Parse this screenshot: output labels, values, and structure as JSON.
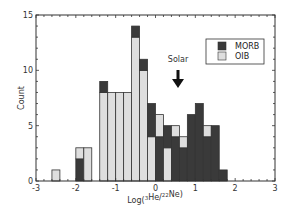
{
  "chart_data": {
    "type": "bar",
    "stacked": true,
    "title": "",
    "xlabel": "Log(3He/22Ne)",
    "xlabel_parts": {
      "prefix": "Log(",
      "sup1": "3",
      "mid": "He/",
      "sup2": "22",
      "suffix": "Ne)"
    },
    "ylabel": "Count",
    "xlim": [
      -3,
      3
    ],
    "ylim": [
      0,
      15
    ],
    "x_ticks": [
      -3,
      -2,
      -1,
      0,
      1,
      2,
      3
    ],
    "y_ticks": [
      0,
      5,
      10,
      15
    ],
    "bin_width": 0.2,
    "bin_starts": [
      -2.6,
      -2.0,
      -1.8,
      -1.4,
      -1.2,
      -1.0,
      -0.8,
      -0.6,
      -0.4,
      -0.2,
      0.0,
      0.2,
      0.4,
      0.6,
      0.8,
      1.0,
      1.2,
      1.4,
      1.6
    ],
    "series": [
      {
        "name": "MORB",
        "color": "#3a3a3a",
        "values": [
          0,
          2,
          0,
          1,
          0,
          0,
          0,
          1,
          1,
          3,
          4,
          2,
          4,
          3,
          6,
          7,
          4,
          5,
          1
        ]
      },
      {
        "name": "OIB",
        "color": "#dedede",
        "values": [
          1,
          1,
          3,
          8,
          8,
          8,
          8,
          13,
          10,
          4,
          2,
          3,
          1,
          1,
          0,
          0,
          1,
          0,
          0
        ]
      }
    ],
    "stack_order_bottom_first": {
      "default": [
        "MORB",
        "OIB"
      ],
      "exceptions": {
        "-1.4": [
          "OIB",
          "MORB"
        ],
        "-0.6": [
          "OIB",
          "MORB"
        ],
        "-0.4": [
          "OIB",
          "MORB"
        ],
        "-0.2": [
          "OIB",
          "MORB"
        ],
        "0.2": [
          "OIB",
          "MORB"
        ]
      }
    },
    "legend": {
      "position": "upper right",
      "entries": [
        "MORB",
        "OIB"
      ]
    },
    "annotations": [
      {
        "text": "Solar",
        "x": 0.5,
        "arrow": "down"
      }
    ],
    "grid": false
  },
  "legend": {
    "morb_label": "MORB",
    "oib_label": "OIB"
  },
  "annotation": {
    "solar_label": "Solar"
  },
  "axes": {
    "ylabel": "Count"
  }
}
